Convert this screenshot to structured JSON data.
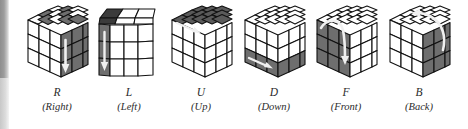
{
  "figure": {
    "background_color": "#ffffff",
    "colors": {
      "sticker_light": "#ffffff",
      "sticker_dark": "#6e6e6e",
      "sticker_dark_shaded": "#585858",
      "outline": "#111111",
      "arrow": "#f2f2f2",
      "caption_text": "#2b2b2b",
      "scan_edge": "#8e8e8e"
    },
    "cubes": [
      {
        "id": "cube-r",
        "letter": "R",
        "word": "(Right)",
        "meaning": "Right",
        "highlighted_face": "right",
        "arrow": "vertical-down-on-right-face",
        "arrow_direction": "down",
        "top_face_pattern": "checkerboard",
        "left_face_pattern": "light",
        "right_face_pattern": "dark"
      },
      {
        "id": "cube-l",
        "letter": "L",
        "word": "(Left)",
        "meaning": "Left",
        "highlighted_face": "left",
        "arrow": "vertical-down-on-left-face",
        "arrow_direction": "down",
        "top_face_pattern": "dark",
        "left_face_pattern": "dark",
        "right_face_pattern": "light"
      },
      {
        "id": "cube-u",
        "letter": "U",
        "word": "(Up)",
        "meaning": "Up",
        "highlighted_face": "top",
        "arrow": "horizontal-on-top-face",
        "arrow_direction": "right",
        "top_face_pattern": "dark",
        "left_face_pattern": "light",
        "right_face_pattern": "light"
      },
      {
        "id": "cube-d",
        "letter": "D",
        "word": "(Down)",
        "meaning": "Down",
        "highlighted_face": "bottom",
        "arrow": "horizontal-on-bottom-row",
        "arrow_direction": "right",
        "top_face_pattern": "light",
        "left_face_pattern": "light-with-dark-bottom-row",
        "right_face_pattern": "light-with-dark-bottom-row"
      },
      {
        "id": "cube-f",
        "letter": "F",
        "word": "(Front)",
        "meaning": "Front",
        "highlighted_face": "front",
        "arrow": "curved-over-top-of-front-face",
        "arrow_direction": "clockwise",
        "top_face_pattern": "light",
        "left_face_pattern": "dark",
        "right_face_pattern": "light"
      },
      {
        "id": "cube-b",
        "letter": "B",
        "word": "(Back)",
        "meaning": "Back",
        "highlighted_face": "back",
        "arrow": "curved-over-top-of-back-face",
        "arrow_direction": "counter-clockwise",
        "top_face_pattern": "light",
        "left_face_pattern": "light",
        "right_face_pattern": "dark"
      }
    ]
  }
}
